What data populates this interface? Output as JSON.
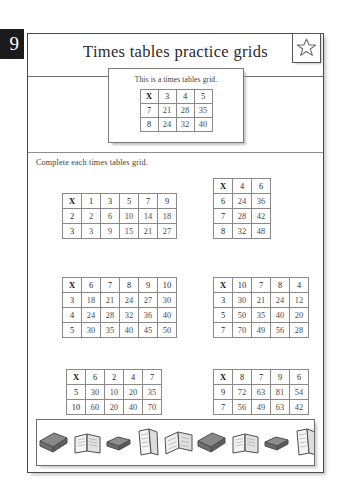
{
  "page": {
    "number": "9",
    "title": "Times tables practice grids",
    "star_icon": "star-icon"
  },
  "example": {
    "caption": "This is a times tables grid.",
    "grid": {
      "corner": "X",
      "columns": [
        "3",
        "4",
        "5"
      ],
      "rows": [
        {
          "label": "7",
          "values": [
            "21",
            "28",
            "35"
          ]
        },
        {
          "label": "8",
          "values": [
            "24",
            "32",
            "40"
          ]
        }
      ]
    }
  },
  "instruction": "Complete each times tables grid.",
  "exercises": [
    {
      "id": "grid-1",
      "corner": "X",
      "columns": [
        "1",
        "3",
        "5",
        "7",
        "9"
      ],
      "rows": [
        {
          "label": "2",
          "values": [
            "2",
            "6",
            "10",
            "14",
            "18"
          ]
        },
        {
          "label": "3",
          "values": [
            "3",
            "9",
            "15",
            "21",
            "27"
          ]
        }
      ]
    },
    {
      "id": "grid-2",
      "corner": "X",
      "columns": [
        "4",
        "6"
      ],
      "rows": [
        {
          "label": "6",
          "values": [
            "24",
            "36"
          ]
        },
        {
          "label": "7",
          "values": [
            "28",
            "42"
          ]
        },
        {
          "label": "8",
          "values": [
            "32",
            "48"
          ]
        }
      ]
    },
    {
      "id": "grid-3",
      "corner": "X",
      "columns": [
        "6",
        "7",
        "8",
        "9",
        "10"
      ],
      "rows": [
        {
          "label": "3",
          "values": [
            "18",
            "21",
            "24",
            "27",
            "30"
          ]
        },
        {
          "label": "4",
          "values": [
            "24",
            "28",
            "32",
            "36",
            "40"
          ]
        },
        {
          "label": "5",
          "values": [
            "30",
            "35",
            "40",
            "45",
            "50"
          ]
        }
      ]
    },
    {
      "id": "grid-4",
      "corner": "X",
      "columns": [
        "10",
        "7",
        "8",
        "4"
      ],
      "rows": [
        {
          "label": "3",
          "values": [
            "30",
            "21",
            "24",
            "12"
          ]
        },
        {
          "label": "5",
          "values": [
            "50",
            "35",
            "40",
            "20"
          ]
        },
        {
          "label": "7",
          "values": [
            "70",
            "49",
            "56",
            "28"
          ]
        }
      ]
    },
    {
      "id": "grid-5",
      "corner": "X",
      "columns": [
        "6",
        "2",
        "4",
        "7"
      ],
      "rows": [
        {
          "label": "5",
          "values": [
            "30",
            "10",
            "20",
            "35"
          ]
        },
        {
          "label": "10",
          "values": [
            "60",
            "20",
            "40",
            "70"
          ]
        }
      ]
    },
    {
      "id": "grid-6",
      "corner": "X",
      "columns": [
        "8",
        "7",
        "9",
        "6"
      ],
      "rows": [
        {
          "label": "9",
          "values": [
            "72",
            "63",
            "81",
            "54"
          ]
        },
        {
          "label": "7",
          "values": [
            "56",
            "49",
            "63",
            "42"
          ]
        }
      ]
    }
  ],
  "footer": {
    "decoration": "books-illustration",
    "book_icons": [
      "closed-book-icon",
      "open-book-icon",
      "closed-book-flat-icon",
      "open-book-tall-icon",
      "open-book-icon"
    ]
  },
  "colors": {
    "ink": "#4a4a4a",
    "heading": "#2b2b2b",
    "rule": "#8a8a8a",
    "tab_bg": "#1b1b1b"
  }
}
